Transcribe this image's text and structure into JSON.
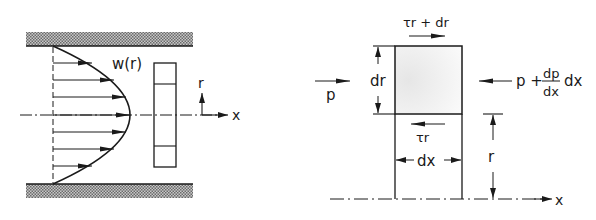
{
  "figure": {
    "left_panel": {
      "name": "velocity-profile-pipe",
      "profile_label": "w(r)",
      "radial_axis_label": "r",
      "axial_axis_label": "x",
      "arrow_count": 7
    },
    "right_panel": {
      "name": "fluid-element-force-balance",
      "top_shear_label": "τr + dr",
      "bottom_shear_label": "τr",
      "left_pressure_label": "p",
      "right_pressure_label_prefix": "p +",
      "right_pressure_fraction_num": "dp",
      "right_pressure_fraction_den": "dx",
      "right_pressure_label_suffix": "dx",
      "height_label": "dr",
      "width_label": "dx",
      "radius_label": "r",
      "axis_label": "x"
    }
  },
  "colors": {
    "ink": "#1a1a1a",
    "hatch": "#8a8a8a",
    "element_fill": "#f2f2f2"
  }
}
